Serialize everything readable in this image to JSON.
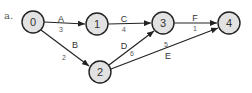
{
  "diagram": {
    "part_label": "a.",
    "nodes": [
      {
        "id": "0",
        "label": "0",
        "x": 33,
        "y": 22
      },
      {
        "id": "1",
        "label": "1",
        "x": 97,
        "y": 24
      },
      {
        "id": "2",
        "label": "2",
        "x": 100,
        "y": 72
      },
      {
        "id": "3",
        "label": "3",
        "x": 163,
        "y": 23
      },
      {
        "id": "4",
        "label": "4",
        "x": 229,
        "y": 23
      }
    ],
    "edges": [
      {
        "name": "A",
        "weight": "3",
        "from": "0",
        "to": "1"
      },
      {
        "name": "B",
        "weight": "2",
        "from": "0",
        "to": "2"
      },
      {
        "name": "C",
        "weight": "4",
        "from": "1",
        "to": "3"
      },
      {
        "name": "D",
        "weight": "6",
        "from": "2",
        "to": "3"
      },
      {
        "name": "E",
        "weight": "5",
        "from": "2",
        "to": "4"
      },
      {
        "name": "F",
        "weight": "1",
        "from": "3",
        "to": "4"
      }
    ],
    "colors": {
      "node_fill": "#e2e2e2",
      "stroke": "#222222",
      "text": "#333333"
    }
  }
}
